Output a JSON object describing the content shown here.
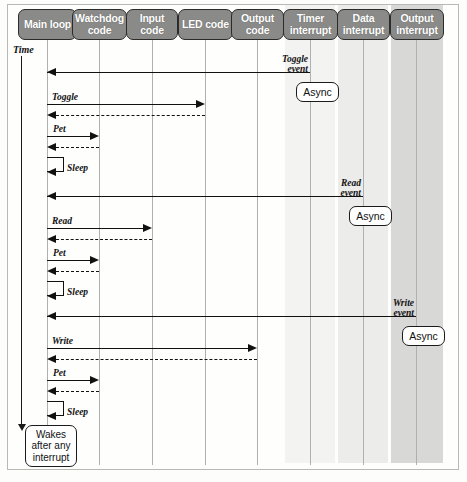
{
  "diagram": {
    "time_axis_label": "Time",
    "lifelines": [
      {
        "id": "main-loop",
        "label": "Main loop",
        "x": 47,
        "shaded": false
      },
      {
        "id": "watchdog-code",
        "label": "Watchdog code",
        "x": 99,
        "shaded": false
      },
      {
        "id": "input-code",
        "label": "Input code",
        "x": 152,
        "shaded": false
      },
      {
        "id": "led-code",
        "label": "LED code",
        "x": 205,
        "shaded": false
      },
      {
        "id": "output-code",
        "label": "Output code",
        "x": 257,
        "shaded": false
      },
      {
        "id": "timer-interrupt",
        "label": "Timer interrupt",
        "x": 310,
        "shaded": true
      },
      {
        "id": "data-interrupt",
        "label": "Data interrupt",
        "x": 363,
        "shaded": true
      },
      {
        "id": "output-interrupt",
        "label": "Output interrupt",
        "x": 416,
        "shaded": true
      }
    ],
    "messages": [
      {
        "id": "toggle-event-msg",
        "label": "Toggle event",
        "from": "timer-interrupt",
        "to": "main-loop",
        "style": "solid",
        "direction": "left"
      },
      {
        "id": "toggle-call",
        "label": "Toggle",
        "from": "main-loop",
        "to": "led-code",
        "style": "solid",
        "direction": "right"
      },
      {
        "id": "toggle-return",
        "label": "",
        "from": "led-code",
        "to": "main-loop",
        "style": "dashed",
        "direction": "left"
      },
      {
        "id": "pet-call-1",
        "label": "Pet",
        "from": "main-loop",
        "to": "watchdog-code",
        "style": "solid",
        "direction": "right"
      },
      {
        "id": "pet-return-1",
        "label": "",
        "from": "watchdog-code",
        "to": "main-loop",
        "style": "dashed",
        "direction": "left"
      },
      {
        "id": "sleep-1",
        "label": "Sleep",
        "from": "main-loop",
        "to": "main-loop",
        "style": "self",
        "direction": "left"
      },
      {
        "id": "read-event-msg",
        "label": "Read event",
        "from": "data-interrupt",
        "to": "main-loop",
        "style": "solid",
        "direction": "left"
      },
      {
        "id": "read-call",
        "label": "Read",
        "from": "main-loop",
        "to": "input-code",
        "style": "solid",
        "direction": "right"
      },
      {
        "id": "read-return",
        "label": "",
        "from": "input-code",
        "to": "main-loop",
        "style": "dashed",
        "direction": "left"
      },
      {
        "id": "pet-call-2",
        "label": "Pet",
        "from": "main-loop",
        "to": "watchdog-code",
        "style": "solid",
        "direction": "right"
      },
      {
        "id": "pet-return-2",
        "label": "",
        "from": "watchdog-code",
        "to": "main-loop",
        "style": "dashed",
        "direction": "left"
      },
      {
        "id": "sleep-2",
        "label": "Sleep",
        "from": "main-loop",
        "to": "main-loop",
        "style": "self",
        "direction": "left"
      },
      {
        "id": "write-event-msg",
        "label": "Write event",
        "from": "output-interrupt",
        "to": "main-loop",
        "style": "solid",
        "direction": "left"
      },
      {
        "id": "write-call",
        "label": "Write",
        "from": "main-loop",
        "to": "output-code",
        "style": "solid",
        "direction": "right"
      },
      {
        "id": "write-return",
        "label": "",
        "from": "output-code",
        "to": "main-loop",
        "style": "dashed",
        "direction": "left"
      },
      {
        "id": "pet-call-3",
        "label": "Pet",
        "from": "main-loop",
        "to": "watchdog-code",
        "style": "solid",
        "direction": "right"
      },
      {
        "id": "pet-return-3",
        "label": "",
        "from": "watchdog-code",
        "to": "main-loop",
        "style": "dashed",
        "direction": "left"
      },
      {
        "id": "sleep-3",
        "label": "Sleep",
        "from": "main-loop",
        "to": "main-loop",
        "style": "self",
        "direction": "left"
      }
    ],
    "event_labels": {
      "toggle_event_line1": "Toggle",
      "toggle_event_line2": "event",
      "read_event_line1": "Read",
      "read_event_line2": "event",
      "write_event_line1": "Write",
      "write_event_line2": "event"
    },
    "call_labels": {
      "toggle": "Toggle",
      "read": "Read",
      "write": "Write",
      "pet_1": "Pet",
      "pet_2": "Pet",
      "pet_3": "Pet",
      "sleep_1": "Sleep",
      "sleep_2": "Sleep",
      "sleep_3": "Sleep"
    },
    "notes": [
      {
        "id": "async-note-1",
        "label": "Async",
        "attached_to": "timer-interrupt"
      },
      {
        "id": "async-note-2",
        "label": "Async",
        "attached_to": "data-interrupt"
      },
      {
        "id": "async-note-3",
        "label": "Async",
        "attached_to": "output-interrupt"
      },
      {
        "id": "wakes-note",
        "label": "Wakes after any interrupt",
        "attached_to": "main-loop"
      }
    ],
    "wakes_note": {
      "line1": "Wakes",
      "line2": "after any",
      "line3": "interrupt"
    },
    "async_label": "Async",
    "colors": {
      "actor_fill": "#8a8a88",
      "actor_border": "#2b2b2b",
      "actor_text": "#ffffff",
      "line": "#111111",
      "lifeline": "#b0b0ac",
      "band_timer": "#f3f3f2",
      "band_data": "#ececeb",
      "band_output": "#d8d8d6",
      "frame_border": "#b9b9b4",
      "background": "#fefefd"
    }
  }
}
